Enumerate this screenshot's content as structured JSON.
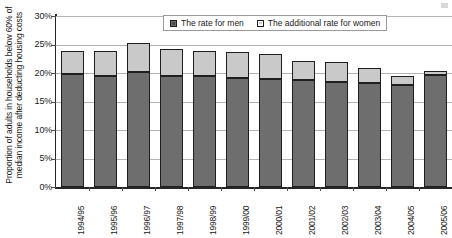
{
  "chart_data": {
    "type": "bar",
    "subtype": "stacked",
    "title": "",
    "xlabel": "",
    "ylabel": "Proportion of adults in households below 60% of median income after deducting housing costs",
    "ylim": [
      0,
      30
    ],
    "ytick_values": [
      0,
      5,
      10,
      15,
      20,
      25,
      30
    ],
    "ytick_labels": [
      "0%",
      "5%",
      "10%",
      "15%",
      "20%",
      "25%",
      "30%"
    ],
    "yaxis_unit": "%",
    "grid": true,
    "legend_position": "top-center",
    "categories": [
      "1994/95",
      "1995/96",
      "1996/97",
      "1997/98",
      "1998/99",
      "1999/00",
      "2000/01",
      "2001/02",
      "2002/03",
      "2003/04",
      "2004/05",
      "2005/06"
    ],
    "series": [
      {
        "name": "The rate for men",
        "color": "#6e6e6e",
        "values": [
          19.9,
          19.5,
          20.1,
          19.4,
          19.4,
          19.2,
          19.0,
          18.7,
          18.5,
          18.3,
          17.9,
          19.7
        ]
      },
      {
        "name": "The additional rate for women",
        "color": "#c9c9c9",
        "values": [
          4.0,
          4.4,
          5.1,
          4.9,
          4.5,
          4.4,
          4.3,
          3.4,
          3.5,
          2.5,
          1.5,
          0.7
        ]
      }
    ],
    "totals": [
      23.9,
      23.9,
      25.2,
      24.3,
      23.9,
      23.6,
      23.3,
      22.1,
      22.0,
      20.8,
      19.4,
      20.4
    ]
  },
  "legend": {
    "entries": [
      {
        "label": "The rate for men",
        "swatch": "filled-dark-square-icon"
      },
      {
        "label": "The additional rate for women",
        "swatch": "filled-light-square-icon"
      }
    ]
  },
  "colors": {
    "men": "#6e6e6e",
    "women": "#c9c9c9",
    "bar_outline": "#1f1f1f",
    "gridline": "#b4b4b4",
    "axis": "#262626",
    "background": "#ffffff"
  }
}
